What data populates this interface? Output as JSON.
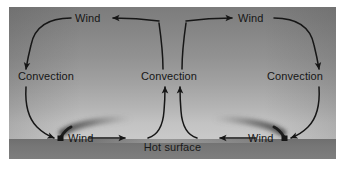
{
  "figure": {
    "type": "diagram",
    "background_top_color": "#7c7c7c",
    "background_bottom_color": "#c9c9c9",
    "surface_color": "#767676",
    "ink_color": "#161616"
  },
  "surface": {
    "label": "Hot surface"
  },
  "labels": {
    "wind_top_left": "Wind",
    "wind_top_right": "Wind",
    "convection_left": "Convection",
    "convection_center": "Convection",
    "convection_right": "Convection",
    "wind_bottom_left": "Wind",
    "wind_bottom_right": "Wind"
  },
  "flow": {
    "cells": [
      {
        "name": "left-convection-cell",
        "rotation": "clockwise",
        "stages": [
          "Wind",
          "Convection",
          "Wind",
          "Convection"
        ]
      },
      {
        "name": "right-convection-cell",
        "rotation": "counterclockwise",
        "stages": [
          "Wind",
          "Convection",
          "Wind",
          "Convection"
        ]
      }
    ],
    "rising_branch": "center",
    "sinking_branches": [
      "left",
      "right"
    ]
  },
  "sources": [
    {
      "name": "left-smokestack",
      "plume_direction": "right"
    },
    {
      "name": "right-smokestack",
      "plume_direction": "left"
    }
  ]
}
